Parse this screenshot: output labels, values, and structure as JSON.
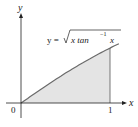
{
  "chart_data": {
    "type": "area",
    "title": "",
    "function_label": "y = √(x tan⁻¹x)",
    "function_parts": {
      "lhs": "y =",
      "radicand": "x tan",
      "sup": "−1",
      "arg": "x"
    },
    "xlabel": "x",
    "ylabel": "y",
    "x_ticks": [
      "0",
      "1"
    ],
    "xlim": [
      0,
      1.12
    ],
    "ylim": [
      0,
      1.5
    ],
    "shaded_region": {
      "from": 0,
      "to": 1
    },
    "x": [
      0,
      0.1,
      0.2,
      0.3,
      0.4,
      0.5,
      0.6,
      0.7,
      0.8,
      0.9,
      1.0,
      1.1
    ],
    "values": [
      0,
      0.1,
      0.199,
      0.296,
      0.39,
      0.481,
      0.566,
      0.647,
      0.722,
      0.791,
      0.886,
      0.958
    ],
    "colors": {
      "fill": "#e4e4e4",
      "curve": "#6a6a6a",
      "axis": "#222222"
    }
  }
}
